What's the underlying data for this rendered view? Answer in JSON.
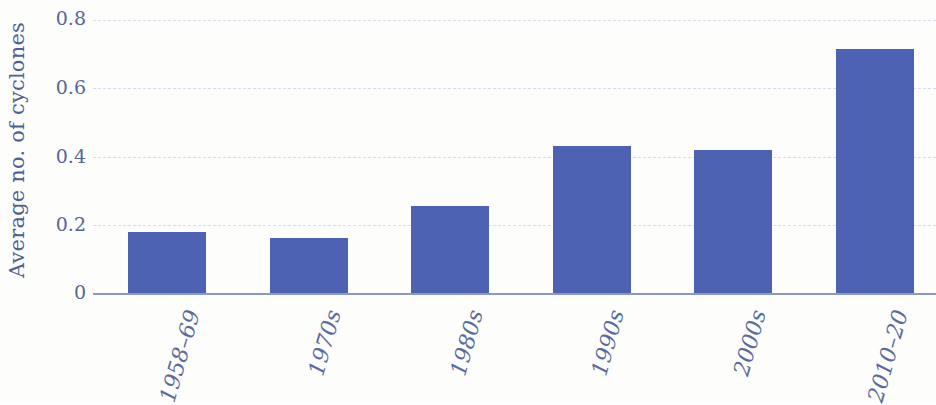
{
  "chart_data": {
    "type": "bar",
    "title": "",
    "subtitle": "",
    "xlabel": "",
    "ylabel": "Average no. of cyclones",
    "categories": [
      "1958–69",
      "1970s",
      "1980s",
      "1990s",
      "2000s",
      "2010–20"
    ],
    "values": [
      0.18,
      0.16,
      0.255,
      0.43,
      0.42,
      0.715
    ],
    "series": [
      {
        "name": "Average no. of cyclones",
        "values": [
          0.18,
          0.16,
          0.255,
          0.43,
          0.42,
          0.715
        ]
      }
    ],
    "ylim": [
      0,
      0.8
    ],
    "y_ticks": [
      0,
      0.2,
      0.4,
      0.6,
      0.8
    ],
    "y_tick_labels": [
      "0",
      "0.2",
      "0.4",
      "0.6",
      "0.8"
    ],
    "grid": true,
    "grid_style": "dashed-horizontal",
    "legend": false,
    "legend_position": "none",
    "bar_color": "#4e62b4",
    "text_color": "#566599",
    "axis_color": "#8a9ac4",
    "grid_color": "#d7dced",
    "background_color": "#fdfdfc",
    "x_tick_label_rotation": "-74"
  }
}
